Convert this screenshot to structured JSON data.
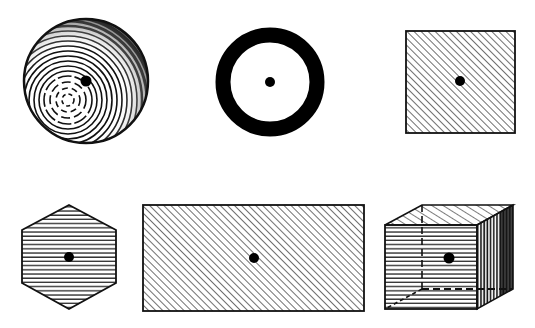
{
  "figure": {
    "ink_color": "#111111",
    "background": "#ffffff",
    "shapes": [
      {
        "name": "sphere",
        "label": "Sphere",
        "shading": "concentric rings",
        "centroid": [
          86,
          81
        ]
      },
      {
        "name": "ring",
        "label": "Ring (annulus)",
        "shading": "solid black band",
        "centroid": [
          270,
          82
        ]
      },
      {
        "name": "square",
        "label": "Square",
        "shading": "diagonal hatch",
        "centroid": [
          460,
          81
        ]
      },
      {
        "name": "hexagon",
        "label": "Hexagon",
        "shading": "horizontal hatch",
        "centroid": [
          69,
          257
        ]
      },
      {
        "name": "rectangle",
        "label": "Rectangle",
        "shading": "diagonal hatch",
        "centroid": [
          254,
          258
        ]
      },
      {
        "name": "cube",
        "label": "Cube",
        "shading": "hatched faces with hidden edges dashed",
        "centroid": [
          449,
          258
        ]
      }
    ]
  },
  "caption": {
    "text": ""
  }
}
